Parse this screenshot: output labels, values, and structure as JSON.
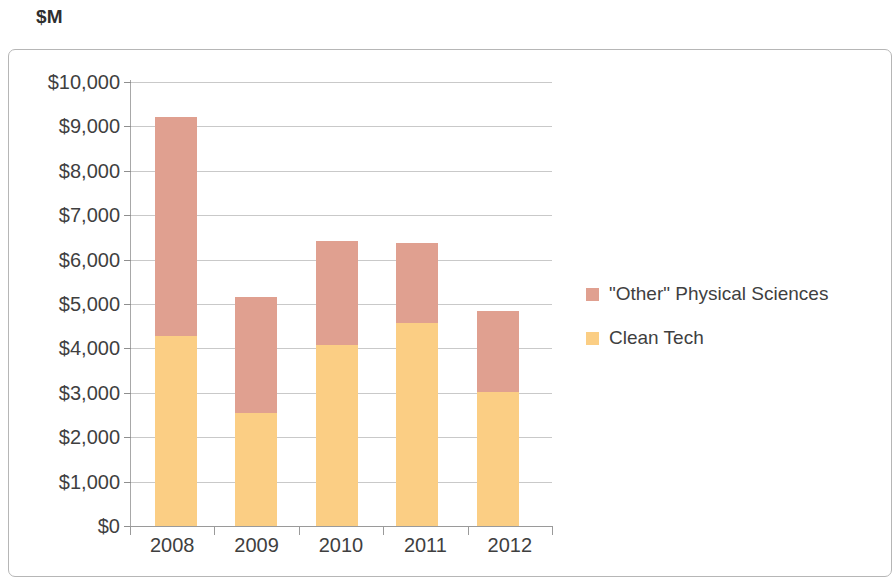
{
  "title": "$M",
  "colors": {
    "other_physical_sciences": "#E0A090",
    "clean_tech": "#FBCE84",
    "gridline": "#c9c9c9",
    "axis": "#9a9a9a",
    "frame_border": "#b6b6b6",
    "text": "#3f3f3f"
  },
  "legend": {
    "items": [
      {
        "label": "\"Other\" Physical Sciences",
        "color": "#E0A090"
      },
      {
        "label": "Clean Tech",
        "color": "#FBCE84"
      }
    ]
  },
  "axis": {
    "y_ticks": [
      "$10,000",
      "$9,000",
      "$8,000",
      "$7,000",
      "$6,000",
      "$5,000",
      "$4,000",
      "$3,000",
      "$2,000",
      "$1,000",
      "$0"
    ],
    "x_ticks": [
      "2008",
      "2009",
      "2010",
      "2011",
      "2012"
    ]
  },
  "chart_data": {
    "type": "bar",
    "stacked": true,
    "title": "$M",
    "xlabel": "",
    "ylabel": "$M",
    "categories": [
      "2008",
      "2009",
      "2010",
      "2011",
      "2012"
    ],
    "series": [
      {
        "name": "Clean Tech",
        "color": "#FBCE84",
        "values": [
          4290,
          2550,
          4080,
          4570,
          3025
        ]
      },
      {
        "name": "\"Other\" Physical Sciences",
        "color": "#E0A090",
        "values": [
          4920,
          2600,
          2340,
          1810,
          1825
        ]
      }
    ],
    "totals": [
      9210,
      5150,
      6420,
      6380,
      4850
    ],
    "ylim": [
      0,
      10000
    ],
    "ytick_values": [
      0,
      1000,
      2000,
      3000,
      4000,
      5000,
      6000,
      7000,
      8000,
      9000,
      10000
    ],
    "ytick_labels": [
      "$0",
      "$1,000",
      "$2,000",
      "$3,000",
      "$4,000",
      "$5,000",
      "$6,000",
      "$7,000",
      "$8,000",
      "$9,000",
      "$10,000"
    ],
    "grid": true,
    "grid_axis": "y",
    "legend_position": "right"
  },
  "geometry": {
    "plot_left": 130,
    "plot_top": 82,
    "plot_width": 422,
    "plot_height": 444,
    "bar_width": 42,
    "bar_x": [
      25,
      105,
      186,
      266,
      347
    ]
  }
}
